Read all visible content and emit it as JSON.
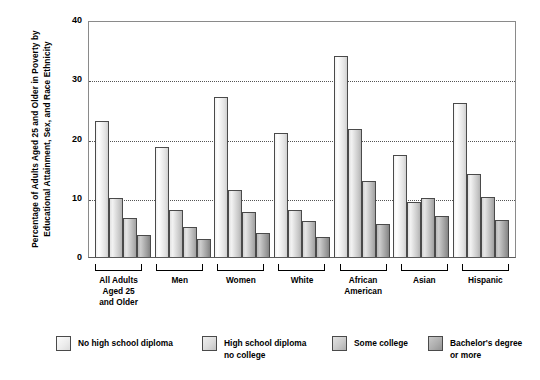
{
  "chart_data": {
    "type": "bar",
    "title": "",
    "xlabel": "",
    "ylabel": "Percentage of Adults Aged 25 and Older in Poverty by Educational Attainment, Sex, and Race Ethnicity",
    "ylim": [
      0,
      40
    ],
    "yticks": [
      40,
      30,
      20,
      10,
      0
    ],
    "grid": "horizontal-dotted at 10, 20, 30",
    "legend_position": "bottom",
    "categories": [
      "All Adults\nAged 25\nand Older",
      "Men",
      "Women",
      "White",
      "African\nAmerican",
      "Asian",
      "Hispanic"
    ],
    "series": [
      {
        "name": "No high school diploma",
        "values": [
          23.0,
          18.5,
          27.0,
          21.0,
          34.0,
          17.3,
          26.0
        ]
      },
      {
        "name": "High school diploma\nno college",
        "values": [
          10.0,
          8.0,
          11.3,
          8.0,
          21.6,
          9.3,
          14.0
        ]
      },
      {
        "name": "Some college",
        "values": [
          6.6,
          5.0,
          7.6,
          6.1,
          12.8,
          10.0,
          10.2
        ]
      },
      {
        "name": "Bachelor's degree\nor more",
        "values": [
          3.7,
          3.0,
          4.1,
          3.4,
          5.5,
          7.0,
          6.2
        ]
      }
    ],
    "colors": [
      "#f0f0f0",
      "#dcdcdc",
      "#c4c4c4",
      "#a5a5a5"
    ]
  }
}
